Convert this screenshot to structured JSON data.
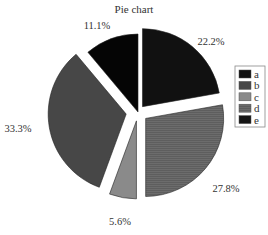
{
  "chart_data": {
    "type": "pie",
    "title": "Pie chart",
    "categories": [
      "a",
      "b",
      "c",
      "d",
      "e"
    ],
    "values": [
      22.2,
      33.3,
      5.6,
      27.8,
      11.1
    ],
    "labels": [
      "22.2%",
      "33.3%",
      "5.6%",
      "27.8%",
      "11.1%"
    ],
    "colors": [
      "#111111",
      "#474747",
      "#8a8a8a",
      "#6a6a6a",
      "#050505"
    ],
    "exploded": [
      "a",
      "b",
      "c",
      "d"
    ],
    "legend_position": "right",
    "xlabel": "",
    "ylabel": ""
  },
  "legend": {
    "items": [
      {
        "label": "a",
        "color": "#111111"
      },
      {
        "label": "b",
        "color": "#474747"
      },
      {
        "label": "c",
        "color": "#8a8a8a"
      },
      {
        "label": "d",
        "color": "#6a6a6a"
      },
      {
        "label": "e",
        "color": "#151515"
      }
    ]
  }
}
